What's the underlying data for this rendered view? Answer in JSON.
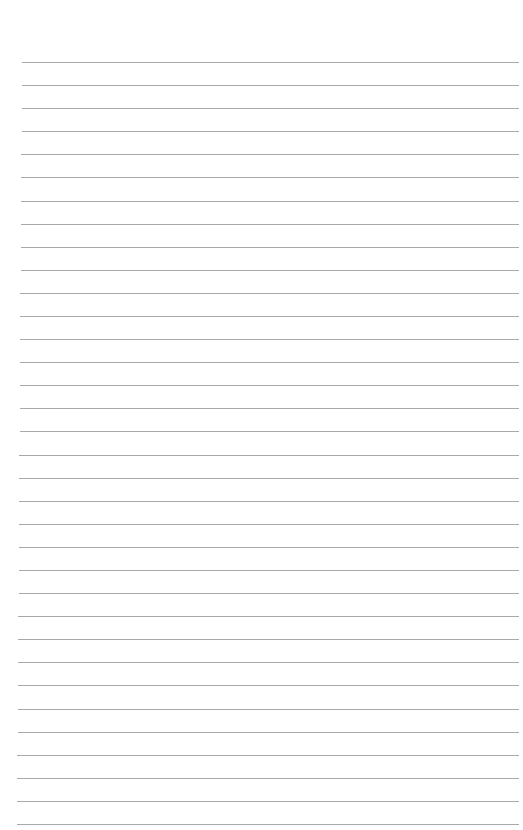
{
  "page": {
    "type": "lined-paper",
    "background_color": "#ffffff",
    "line_color": "#9a9a9a",
    "line_count": 34,
    "first_line_y": 62,
    "last_line_y": 824,
    "line_left_x_top": 22,
    "line_left_x_bottom": 17,
    "line_right_x": 519
  }
}
